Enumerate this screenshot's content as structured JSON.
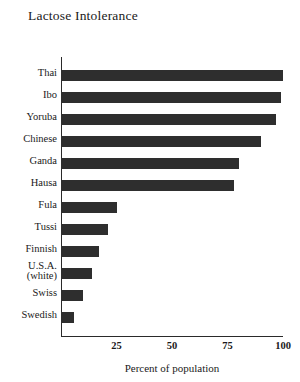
{
  "chart_data": {
    "type": "bar",
    "orientation": "horizontal",
    "title": "Lactose Intolerance",
    "xlabel": "Percent of population",
    "ylabel": "",
    "xlim": [
      0,
      100
    ],
    "xticks": [
      25,
      50,
      75,
      100
    ],
    "xtick_labels": [
      "25",
      "50",
      "75",
      "100"
    ],
    "grid": false,
    "legend": false,
    "bar_color": "#2e2e2e",
    "categories": [
      "Thai",
      "Ibo",
      "Yoruba",
      "Chinese",
      "Ganda",
      "Hausa",
      "Fula",
      "Tussi",
      "Finnish",
      "U.S.A. (white)",
      "Swiss",
      "Swedish"
    ],
    "category_labels": [
      {
        "line1": "Thai",
        "line2": ""
      },
      {
        "line1": "Ibo",
        "line2": ""
      },
      {
        "line1": "Yoruba",
        "line2": ""
      },
      {
        "line1": "Chinese",
        "line2": ""
      },
      {
        "line1": "Ganda",
        "line2": ""
      },
      {
        "line1": "Hausa",
        "line2": ""
      },
      {
        "line1": "Fula",
        "line2": ""
      },
      {
        "line1": "Tussi",
        "line2": ""
      },
      {
        "line1": "Finnish",
        "line2": ""
      },
      {
        "line1": "U.S.A.",
        "line2": "(white)"
      },
      {
        "line1": "Swiss",
        "line2": ""
      },
      {
        "line1": "Swedish",
        "line2": ""
      }
    ],
    "values": [
      100,
      99,
      97,
      90,
      80,
      78,
      25,
      21,
      17,
      14,
      10,
      6
    ]
  }
}
